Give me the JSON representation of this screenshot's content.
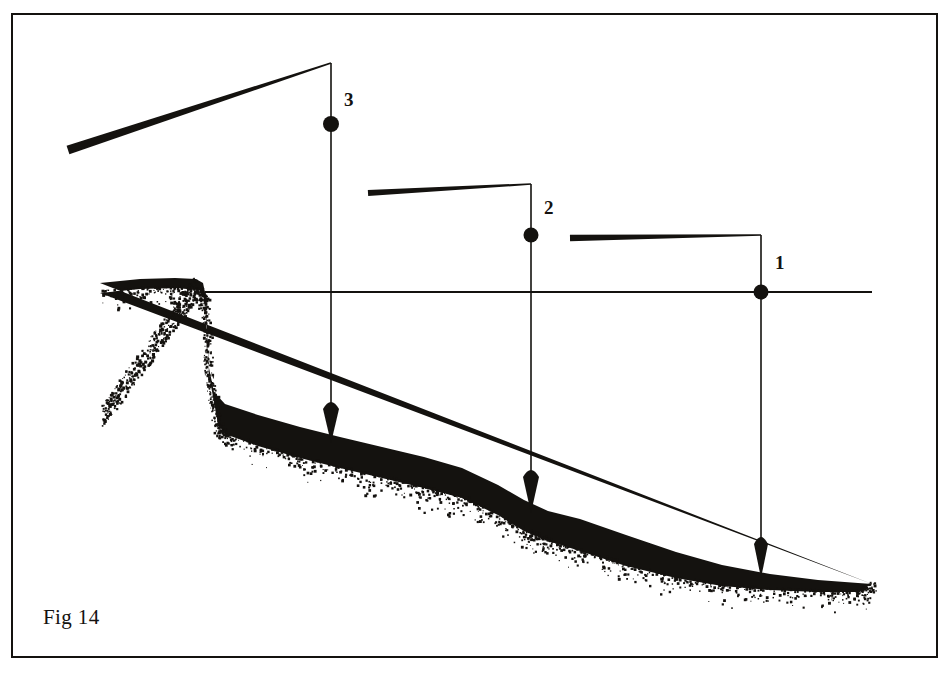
{
  "figure": {
    "caption": "Fig 14",
    "border_color": "#14120f",
    "ink_color": "#14120f",
    "background_color": "#ffffff",
    "frame": {
      "x": 11,
      "y": 13,
      "width": 927,
      "height": 645
    }
  },
  "datum_line": {
    "name": "waterline",
    "y": 292,
    "x_start": 205,
    "x_end": 872
  },
  "stations": [
    {
      "id": "1",
      "label": "1",
      "label_x": 775,
      "label_y": 252,
      "node_x": 761,
      "node_y": 292,
      "node_radius": 7.5,
      "bar": {
        "x_left": 570,
        "y_left": 238,
        "x_right": 761,
        "y_right": 235,
        "thickness_left": 6.5,
        "thickness_right": 1.6
      },
      "riser": {
        "x": 761,
        "y_top": 235,
        "y_bottom": 292
      },
      "drop_line": {
        "x": 761,
        "y_top": 292,
        "y_bottom": 575
      },
      "arrow": {
        "x": 761,
        "y_tip": 578,
        "half_width": 7,
        "height": 34
      }
    },
    {
      "id": "2",
      "label": "2",
      "label_x": 544,
      "label_y": 197,
      "node_x": 531,
      "node_y": 235,
      "node_radius": 7.5,
      "bar": {
        "x_left": 368,
        "y_left": 193,
        "x_right": 531,
        "y_right": 184,
        "thickness_left": 6.0,
        "thickness_right": 1.6
      },
      "riser": {
        "x": 531,
        "y_top": 184,
        "y_bottom": 235
      },
      "drop_line": {
        "x": 531,
        "y_top": 235,
        "y_bottom": 507
      },
      "arrow": {
        "x": 531,
        "y_tip": 513,
        "half_width": 8,
        "height": 36
      }
    },
    {
      "id": "3",
      "label": "3",
      "label_x": 344,
      "label_y": 89,
      "node_x": 331,
      "node_y": 124,
      "node_radius": 8.0,
      "bar": {
        "x_left": 68,
        "y_left": 150,
        "x_right": 331,
        "y_right": 63,
        "thickness_left": 9.0,
        "thickness_right": 1.8
      },
      "riser": {
        "x": 331,
        "y_top": 63,
        "y_bottom": 124
      },
      "drop_line": {
        "x": 331,
        "y_top": 124,
        "y_bottom": 437
      },
      "arrow": {
        "x": 331,
        "y_tip": 443,
        "half_width": 8,
        "height": 34
      }
    }
  ],
  "terrain": {
    "name": "seabed-profile",
    "fill_color": "#14120f",
    "crest_outline": "M 100,283 L 140,279 L 175,278 L 196,279 L 203,283 L 206,297 L 207,330 L 209,368 L 214,392 L 225,404 L 258,415 L 300,427 L 340,437 L 382,447 L 424,457 L 462,468 L 498,485 L 524,500 L 548,511 L 580,519 L 626,535 L 676,552 L 722,565 L 770,574 L 818,580 L 858,583 L 872,584",
    "base_outline": "M 872,584 L 858,592 L 818,592 L 770,590 L 722,586 L 676,578 L 626,566 L 580,551 L 548,541 L 524,531 L 498,515 L 462,498 L 424,488 L 382,478 L 340,468 L 300,458 L 258,446 L 225,434 L 218,424 L 214,402 L 209,375 L 207,335 L 205,300 L 199,290 L 175,288 L 140,289 L 100,293 Z",
    "stipple_seed": 20240614,
    "stipple_count": 1500
  }
}
